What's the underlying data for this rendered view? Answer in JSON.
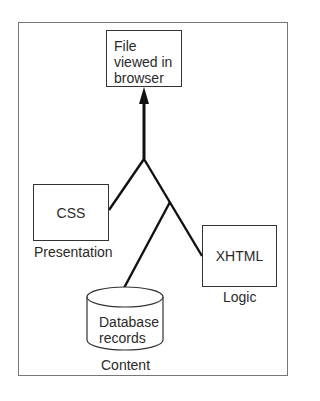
{
  "diagram": {
    "title_fragment": "",
    "nodes": {
      "output": {
        "text_lines": [
          "File",
          "viewed in",
          "browser"
        ]
      },
      "css": {
        "text": "CSS",
        "caption": "Presentation"
      },
      "xhtml": {
        "text": "XHTML",
        "caption": "Logic"
      },
      "database": {
        "text_lines": [
          "Database",
          "records"
        ],
        "caption": "Content"
      }
    },
    "edges": [
      {
        "from": "css",
        "to": "junction-top"
      },
      {
        "from": "junction-lower",
        "to": "junction-top"
      },
      {
        "from": "xhtml",
        "to": "junction-lower"
      },
      {
        "from": "database",
        "to": "junction-lower"
      },
      {
        "from": "junction-top",
        "to": "output",
        "arrow": true
      }
    ],
    "colors": {
      "stroke": "#111111",
      "frame": "#777777",
      "text": "#2a2a2a"
    }
  }
}
